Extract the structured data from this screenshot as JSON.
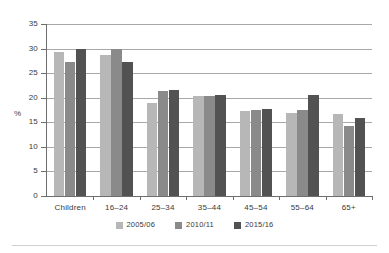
{
  "chart_data": {
    "type": "bar",
    "title": "",
    "subtitle": "",
    "xlabel": "",
    "ylabel": "%",
    "ylim": [
      0,
      35
    ],
    "ytick_step": 5,
    "yticks": [
      "0",
      "5",
      "10",
      "15",
      "20",
      "25",
      "30",
      "35"
    ],
    "grid": true,
    "legend_position": "bottom-center",
    "categories": [
      "Children",
      "16–24",
      "25–34",
      "35–44",
      "45–54",
      "55–64",
      "65+"
    ],
    "series": [
      {
        "name": "2005/06",
        "color": "#b7b7b7",
        "values": [
          29.4,
          28.6,
          19.0,
          20.4,
          17.2,
          16.9,
          16.6
        ]
      },
      {
        "name": "2010/11",
        "color": "#8a8a8a",
        "values": [
          27.3,
          30.0,
          21.4,
          20.4,
          17.6,
          17.6,
          14.2
        ]
      },
      {
        "name": "2015/16",
        "color": "#525252",
        "values": [
          29.9,
          27.2,
          21.5,
          20.6,
          17.8,
          20.6,
          15.9
        ]
      }
    ]
  },
  "colors": {
    "axis": "#6e6e6e",
    "gridline": "#a8a8a8",
    "text": "#3a3a3a",
    "background": "#ffffff",
    "rule": "#d0d0d0"
  }
}
